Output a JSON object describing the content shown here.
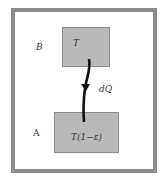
{
  "diagram": {
    "region_upper": {
      "label": "B"
    },
    "region_lower": {
      "label": "A"
    },
    "box_upper": {
      "text": "T"
    },
    "box_lower": {
      "text": "T(1−ε)"
    },
    "flow": {
      "label": "dQ"
    },
    "colors": {
      "border": "#8c8c8c",
      "box_fill": "#b9b9b9",
      "arrow": "#111111"
    }
  }
}
